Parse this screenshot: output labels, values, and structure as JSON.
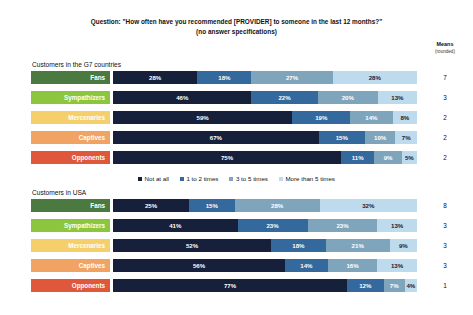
{
  "title": {
    "line1": "Question: \"How often have you recommended [PROVIDER] to someone in the last 12 months?\"",
    "line2": "(no answer specifications)"
  },
  "means_header": {
    "line1": "Means",
    "line2": "(rounded)"
  },
  "legend": [
    {
      "label": "Not at all",
      "color": "#17203a"
    },
    {
      "label": "1 to 2 times",
      "color": "#33699c"
    },
    {
      "label": "3 to 5 times",
      "color": "#7fa5bd"
    },
    {
      "label": "More than 5 times",
      "color": "#bedbee"
    }
  ],
  "panels": [
    {
      "label": "Customers in the G7 countries",
      "rows": [
        {
          "category": "Fans",
          "cat_color": "#4a7a3f",
          "values": [
            28,
            18,
            27,
            28
          ],
          "labels": [
            "28%",
            "18%",
            "27%",
            "28%"
          ],
          "mean": "7"
        },
        {
          "category": "Sympathizers",
          "cat_color": "#8cc63f",
          "values": [
            46,
            22,
            20,
            13
          ],
          "labels": [
            "46%",
            "22%",
            "20%",
            "13%"
          ],
          "mean": "3"
        },
        {
          "category": "Mercenaries",
          "cat_color": "#f5cf6b",
          "values": [
            59,
            19,
            14,
            8
          ],
          "labels": [
            "59%",
            "19%",
            "14%",
            "8%"
          ],
          "mean": "2"
        },
        {
          "category": "Captives",
          "cat_color": "#f0a363",
          "values": [
            67,
            15,
            10,
            7
          ],
          "labels": [
            "67%",
            "15%",
            "10%",
            "7%"
          ],
          "mean": "2"
        },
        {
          "category": "Opponents",
          "cat_color": "#e0583b",
          "values": [
            75,
            11,
            9,
            5
          ],
          "labels": [
            "75%",
            "11%",
            "9%",
            "5%"
          ],
          "mean": "2"
        }
      ]
    },
    {
      "label": "Customers in USA",
      "rows": [
        {
          "category": "Fans",
          "cat_color": "#4a7a3f",
          "values": [
            25,
            15,
            28,
            32
          ],
          "labels": [
            "25%",
            "15%",
            "28%",
            "32%"
          ],
          "mean": "8"
        },
        {
          "category": "Sympathizers",
          "cat_color": "#8cc63f",
          "values": [
            41,
            23,
            23,
            13
          ],
          "labels": [
            "41%",
            "23%",
            "23%",
            "13%"
          ],
          "mean": "3"
        },
        {
          "category": "Mercenaries",
          "cat_color": "#f5cf6b",
          "values": [
            52,
            18,
            21,
            9
          ],
          "labels": [
            "52%",
            "18%",
            "21%",
            "9%"
          ],
          "mean": "3"
        },
        {
          "category": "Captives",
          "cat_color": "#f0a363",
          "values": [
            56,
            14,
            16,
            13
          ],
          "labels": [
            "56%",
            "14%",
            "16%",
            "13%"
          ],
          "mean": "3"
        },
        {
          "category": "Opponents",
          "cat_color": "#e0583b",
          "values": [
            77,
            12,
            7,
            4
          ],
          "labels": [
            "77%",
            "12%",
            "7%",
            "4%"
          ],
          "mean": "1"
        }
      ]
    }
  ],
  "chart_data": {
    "type": "bar",
    "title": "Question: \"How often have you recommended [PROVIDER] to someone in the last 12 months?\" (no answer specifications)",
    "subtitle": "(no answer specifications)",
    "orientation": "horizontal",
    "stacked": true,
    "stacked_mode": "percent",
    "xlabel": "",
    "ylabel": "",
    "xlim": [
      0,
      100
    ],
    "grid": false,
    "legend_position": "middle-center",
    "series": [
      {
        "name": "Not at all",
        "color": "#17203a"
      },
      {
        "name": "1 to 2 times",
        "color": "#33699c"
      },
      {
        "name": "3 to 5 times",
        "color": "#7fa5bd"
      },
      {
        "name": "More than 5 times",
        "color": "#bedbee"
      }
    ],
    "groups": [
      {
        "name": "Customers in the G7 countries",
        "categories": [
          "Fans",
          "Sympathizers",
          "Mercenaries",
          "Captives",
          "Opponents"
        ],
        "values": [
          [
            28,
            18,
            27,
            28
          ],
          [
            46,
            22,
            20,
            13
          ],
          [
            59,
            19,
            14,
            8
          ],
          [
            67,
            15,
            10,
            7
          ],
          [
            75,
            11,
            9,
            5
          ]
        ],
        "means_rounded": [
          7,
          3,
          2,
          2,
          2
        ]
      },
      {
        "name": "Customers in USA",
        "categories": [
          "Fans",
          "Sympathizers",
          "Mercenaries",
          "Captives",
          "Opponents"
        ],
        "values": [
          [
            25,
            15,
            28,
            32
          ],
          [
            41,
            23,
            23,
            13
          ],
          [
            52,
            18,
            21,
            9
          ],
          [
            56,
            14,
            16,
            13
          ],
          [
            77,
            12,
            7,
            4
          ]
        ],
        "means_rounded": [
          8,
          3,
          3,
          3,
          1
        ]
      }
    ],
    "annotations": {
      "means_column_header": "Means (rounded)"
    }
  }
}
